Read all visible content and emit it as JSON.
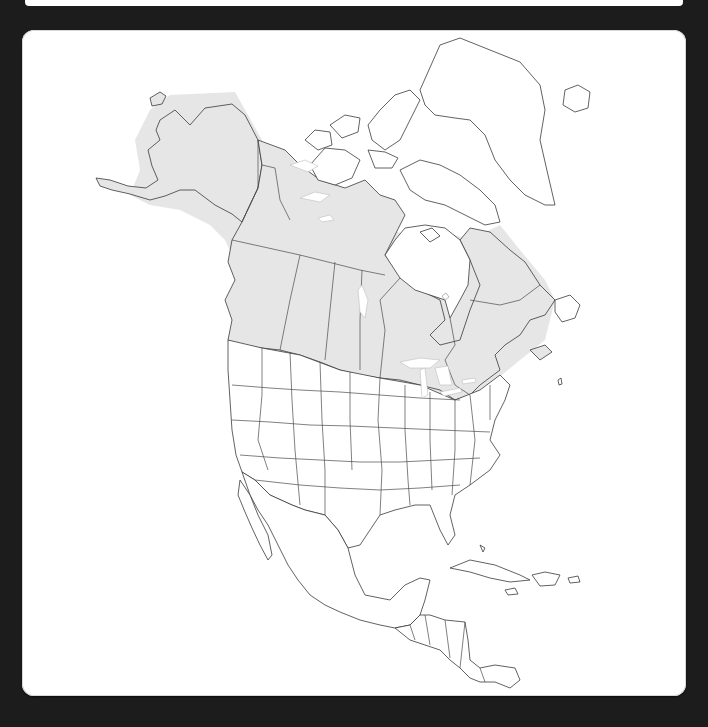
{
  "caption": {
    "text": ""
  },
  "map": {
    "title": "Range map of North America",
    "region": "North America",
    "projection": "Lambert azimuthal (stylized)",
    "colors": {
      "card_background": "#ffffff",
      "page_background": "#1c1c1c",
      "range_fill": "#e6e6e6",
      "outline": "#3a3a3a"
    },
    "layers": [
      {
        "name": "range-shading",
        "label": "Species range (shaded)"
      },
      {
        "name": "country-outlines",
        "label": "Country and coastline outlines"
      },
      {
        "name": "state-province-borders",
        "label": "State and province borders"
      }
    ],
    "range_covers": [
      "Alaska",
      "Yukon",
      "Northwest Territories (south)",
      "British Columbia (interior)",
      "Alberta",
      "Saskatchewan",
      "Manitoba",
      "Ontario",
      "Quebec",
      "Labrador",
      "New Brunswick",
      "Nova Scotia",
      "Maine",
      "Northern Rockies (Idaho, Montana, Wyoming)",
      "Great Lakes states",
      "New England",
      "New York"
    ]
  }
}
